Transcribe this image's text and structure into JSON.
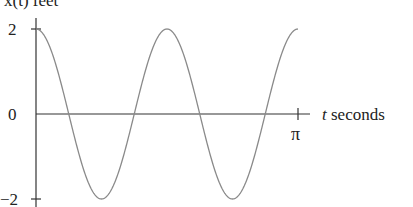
{
  "chart_data": {
    "type": "line",
    "title": "",
    "ylabel": "x(t) feet",
    "xlabel": "t seconds",
    "function": "x(t) = 2cos(4t)",
    "x": [
      0,
      0.3927,
      0.7854,
      1.1781,
      1.5708,
      1.9635,
      2.3562,
      2.7489,
      3.1416
    ],
    "x_labels": [
      "0",
      "π/8",
      "π/4",
      "3π/8",
      "π/2",
      "5π/8",
      "3π/4",
      "7π/8",
      "π"
    ],
    "series": [
      {
        "name": "x(t)",
        "values": [
          2,
          0,
          -2,
          0,
          2,
          0,
          -2,
          0,
          2
        ]
      }
    ],
    "xlim": [
      0,
      3.1416
    ],
    "ylim": [
      -2,
      2
    ],
    "x_ticks": [
      {
        "value": 3.1416,
        "label": "π"
      }
    ],
    "y_ticks": [
      {
        "value": 2,
        "label": "2"
      },
      {
        "value": 0,
        "label": "0"
      },
      {
        "value": -2,
        "label": "−2"
      }
    ],
    "grid": false,
    "legend": null,
    "colors": {
      "curve": "#8a8a8a",
      "axis": "#333333"
    }
  },
  "labels": {
    "y_axis_title": "x(t) feet",
    "x_axis_title_var": "t",
    "x_axis_title_unit": " seconds",
    "tick_y_top": "2",
    "tick_y_zero": "0",
    "tick_y_bottom": "−2",
    "tick_x_pi": "π"
  }
}
